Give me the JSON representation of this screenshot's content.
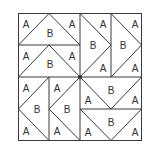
{
  "diagram": {
    "colors": {
      "line": "#3a3a3a",
      "text": "#333333",
      "background": "#ffffff"
    },
    "square": {
      "x": 18,
      "y": 13,
      "width": 124,
      "height": 128
    },
    "center_dot": {
      "x": 80,
      "y": 77
    },
    "units": [
      {
        "quadrant": "top-left",
        "direction": "up",
        "labels": [
          {
            "t": "A",
            "x": 26,
            "y": 24
          },
          {
            "t": "B",
            "x": 50,
            "y": 33
          },
          {
            "t": "A",
            "x": 72,
            "y": 24
          }
        ]
      },
      {
        "quadrant": "top-left",
        "direction": "up",
        "labels": [
          {
            "t": "A",
            "x": 26,
            "y": 56
          },
          {
            "t": "B",
            "x": 50,
            "y": 64
          },
          {
            "t": "A",
            "x": 72,
            "y": 56
          }
        ]
      },
      {
        "quadrant": "top-right",
        "direction": "right",
        "labels": [
          {
            "t": "A",
            "x": 103,
            "y": 24
          },
          {
            "t": "B",
            "x": 93,
            "y": 45
          },
          {
            "t": "A",
            "x": 103,
            "y": 68
          }
        ]
      },
      {
        "quadrant": "top-right",
        "direction": "right",
        "labels": [
          {
            "t": "A",
            "x": 135,
            "y": 24
          },
          {
            "t": "B",
            "x": 123,
            "y": 45
          },
          {
            "t": "A",
            "x": 135,
            "y": 68
          }
        ]
      },
      {
        "quadrant": "bottom-left",
        "direction": "left",
        "labels": [
          {
            "t": "A",
            "x": 26,
            "y": 88
          },
          {
            "t": "B",
            "x": 37,
            "y": 109
          },
          {
            "t": "A",
            "x": 26,
            "y": 131
          }
        ]
      },
      {
        "quadrant": "bottom-left",
        "direction": "left",
        "labels": [
          {
            "t": "A",
            "x": 57,
            "y": 88
          },
          {
            "t": "B",
            "x": 67,
            "y": 109
          },
          {
            "t": "A",
            "x": 57,
            "y": 131
          }
        ]
      },
      {
        "quadrant": "bottom-right",
        "direction": "down",
        "labels": [
          {
            "t": "A",
            "x": 88,
            "y": 100
          },
          {
            "t": "B",
            "x": 111,
            "y": 90
          },
          {
            "t": "A",
            "x": 135,
            "y": 100
          }
        ]
      },
      {
        "quadrant": "bottom-right",
        "direction": "down",
        "labels": [
          {
            "t": "A",
            "x": 88,
            "y": 132
          },
          {
            "t": "B",
            "x": 111,
            "y": 122
          },
          {
            "t": "A",
            "x": 135,
            "y": 132
          }
        ]
      }
    ]
  }
}
